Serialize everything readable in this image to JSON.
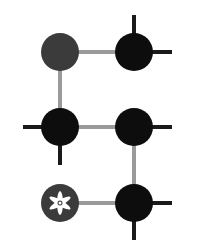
{
  "diagram": {
    "width": 200,
    "height": 244,
    "colors": {
      "background": "#ffffff",
      "connector": "#9a9a9a",
      "spike": "#1a1a1a",
      "node_dark": "#3b3b3b",
      "node_black": "#0d0d0d",
      "flower": "#ffffff"
    },
    "node_radius": 19,
    "nodes": [
      {
        "id": "top-left",
        "cx": 60,
        "cy": 52,
        "fill": "node_dark",
        "glyph": "none"
      },
      {
        "id": "top-right",
        "cx": 134,
        "cy": 52,
        "fill": "node_black",
        "glyph": "none"
      },
      {
        "id": "middle-left",
        "cx": 60,
        "cy": 127,
        "fill": "node_black",
        "glyph": "none"
      },
      {
        "id": "middle-right",
        "cx": 134,
        "cy": 127,
        "fill": "node_black",
        "glyph": "none"
      },
      {
        "id": "bottom-left",
        "cx": 60,
        "cy": 203,
        "fill": "node_dark",
        "glyph": "flower-icon"
      },
      {
        "id": "bottom-right",
        "cx": 134,
        "cy": 203,
        "fill": "node_black",
        "glyph": "none"
      }
    ],
    "connectors": [
      {
        "from": "top-left",
        "to": "top-right"
      },
      {
        "from": "top-left",
        "to": "middle-left"
      },
      {
        "from": "middle-left",
        "to": "middle-right"
      },
      {
        "from": "middle-right",
        "to": "bottom-right"
      },
      {
        "from": "bottom-left",
        "to": "bottom-right"
      }
    ],
    "spikes": [
      {
        "node": "top-right",
        "direction": "up",
        "x1": 134,
        "y1": 52,
        "x2": 134,
        "y2": 15
      },
      {
        "node": "top-right",
        "direction": "right",
        "x1": 134,
        "y1": 52,
        "x2": 172,
        "y2": 52
      },
      {
        "node": "middle-left",
        "direction": "left",
        "x1": 60,
        "y1": 127,
        "x2": 23,
        "y2": 127
      },
      {
        "node": "middle-left",
        "direction": "down",
        "x1": 60,
        "y1": 127,
        "x2": 60,
        "y2": 165
      },
      {
        "node": "middle-right",
        "direction": "right",
        "x1": 134,
        "y1": 127,
        "x2": 172,
        "y2": 127
      },
      {
        "node": "bottom-right",
        "direction": "right",
        "x1": 134,
        "y1": 203,
        "x2": 172,
        "y2": 203
      },
      {
        "node": "bottom-right",
        "direction": "down",
        "x1": 134,
        "y1": 203,
        "x2": 134,
        "y2": 240
      }
    ]
  }
}
